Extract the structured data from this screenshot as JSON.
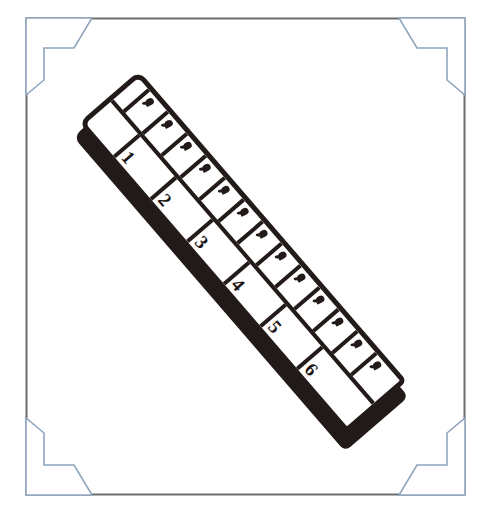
{
  "document": {
    "title": "Ruler illustration",
    "description": "Hand-drawn black-and-white illustration of a diagonal ruler inside a decorative corner frame",
    "background_color": "#ffffff"
  },
  "frame": {
    "name": "decorative-corner-frame",
    "border_color": "#6d6d6d",
    "bracket_color": "#8fa5bd",
    "bracket_fill": "#ffffff",
    "rect": {
      "x": 26,
      "y": 18,
      "width": 439,
      "height": 477
    },
    "corners": [
      {
        "name": "corner-bracket-top-left",
        "position": "top-left"
      },
      {
        "name": "corner-bracket-top-right",
        "position": "top-right"
      },
      {
        "name": "corner-bracket-bottom-left",
        "position": "bottom-left"
      },
      {
        "name": "corner-bracket-bottom-right",
        "position": "bottom-right"
      }
    ]
  },
  "ruler": {
    "name": "ruler",
    "outline_color": "#231b19",
    "face_color": "#ffffff",
    "shadow_color": "#211a18",
    "rotation_degrees": 49.2,
    "length_px": 418,
    "width_px": 86,
    "scales": {
      "major": {
        "label": "inch scale",
        "lead_gap_px": 46,
        "cell_width_px": 56,
        "numbers": [
          "1",
          "2",
          "3",
          "4",
          "5",
          "6"
        ]
      },
      "minor": {
        "label": "tick scale",
        "lead_gap_px": 18,
        "cell_width_px": 29,
        "tick_glyph": "tick-mark",
        "cell_count": 13,
        "ticks": [
          "",
          "",
          "",
          "",
          "",
          "",
          "",
          "",
          "",
          "",
          "",
          "",
          ""
        ]
      }
    }
  }
}
